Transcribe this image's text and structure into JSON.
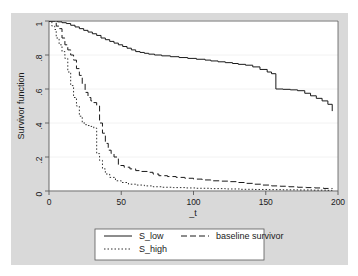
{
  "figure": {
    "background_color": "#ffffff",
    "plot_region_color": "#d9d9d9",
    "plot_area_color": "#ffffff",
    "frame_color": "#4d4d4d",
    "grid_color": "#f2f2f2",
    "line_color": "#1a1a1a"
  },
  "chart_data": {
    "type": "line",
    "title": "",
    "xlabel": "_t",
    "ylabel": "Survivor function",
    "xlim": [
      0,
      200
    ],
    "ylim": [
      0,
      1
    ],
    "xticks": [
      0,
      50,
      100,
      150,
      200
    ],
    "xticklabels": [
      "0",
      "50",
      "100",
      "150",
      "200"
    ],
    "yticks": [
      0,
      0.2,
      0.4,
      0.6,
      0.8,
      1
    ],
    "yticklabels": [
      "0",
      ".2",
      ".4",
      ".6",
      ".8",
      "1"
    ],
    "grid": "horizontal",
    "legend_position": "below",
    "series": [
      {
        "name": "S_low",
        "style": "solid",
        "dash": "none",
        "x": [
          0,
          4,
          6,
          9,
          12,
          15,
          18,
          21,
          24,
          27,
          30,
          33,
          36,
          39,
          42,
          45,
          48,
          51,
          54,
          57,
          60,
          63,
          66,
          69,
          73,
          78,
          84,
          90,
          96,
          102,
          108,
          112,
          117,
          122,
          127,
          131,
          136,
          141,
          146,
          151,
          154,
          157,
          162,
          167,
          172,
          177,
          181,
          185,
          189,
          193,
          196
        ],
        "y": [
          1.0,
          1.0,
          0.995,
          0.99,
          0.985,
          0.975,
          0.965,
          0.955,
          0.945,
          0.935,
          0.925,
          0.915,
          0.9,
          0.89,
          0.88,
          0.87,
          0.86,
          0.85,
          0.84,
          0.83,
          0.82,
          0.815,
          0.81,
          0.805,
          0.8,
          0.795,
          0.79,
          0.785,
          0.78,
          0.775,
          0.77,
          0.765,
          0.76,
          0.755,
          0.75,
          0.745,
          0.74,
          0.73,
          0.715,
          0.7,
          0.69,
          0.6,
          0.598,
          0.595,
          0.59,
          0.575,
          0.56,
          0.545,
          0.53,
          0.51,
          0.47
        ]
      },
      {
        "name": "baseline survivor",
        "style": "dashed",
        "dash": "6,3",
        "x": [
          0,
          3,
          5,
          7,
          9,
          11,
          13,
          15,
          17,
          19,
          21,
          23,
          25,
          27,
          29,
          31,
          33,
          35,
          37,
          39,
          41,
          43,
          45,
          48,
          52,
          56,
          60,
          64,
          68,
          72,
          76,
          82,
          88,
          94,
          100,
          106,
          112,
          118,
          124,
          130,
          136,
          142,
          148,
          154,
          160,
          166,
          172,
          178,
          184,
          190,
          196
        ],
        "y": [
          1.0,
          1.0,
          0.97,
          0.955,
          0.9,
          0.86,
          0.83,
          0.8,
          0.77,
          0.72,
          0.68,
          0.63,
          0.58,
          0.55,
          0.53,
          0.52,
          0.5,
          0.4,
          0.34,
          0.28,
          0.24,
          0.22,
          0.2,
          0.15,
          0.14,
          0.13,
          0.12,
          0.115,
          0.11,
          0.1,
          0.09,
          0.085,
          0.08,
          0.075,
          0.07,
          0.065,
          0.06,
          0.058,
          0.055,
          0.05,
          0.045,
          0.04,
          0.035,
          0.03,
          0.028,
          0.025,
          0.022,
          0.02,
          0.018,
          0.015,
          0.012
        ]
      },
      {
        "name": "S_high",
        "style": "dotted",
        "dash": "1.5,2",
        "x": [
          0,
          2,
          4,
          5,
          7,
          9,
          11,
          13,
          15,
          17,
          19,
          21,
          23,
          25,
          27,
          29,
          31,
          33,
          35,
          37,
          39,
          42,
          46,
          50,
          55,
          60,
          66,
          72,
          78,
          86,
          94,
          102,
          112,
          122,
          132,
          142,
          152,
          162,
          172,
          182,
          192,
          196
        ],
        "y": [
          1.0,
          0.97,
          0.95,
          0.9,
          0.86,
          0.82,
          0.78,
          0.7,
          0.62,
          0.55,
          0.5,
          0.44,
          0.4,
          0.39,
          0.385,
          0.38,
          0.37,
          0.22,
          0.18,
          0.13,
          0.1,
          0.08,
          0.06,
          0.05,
          0.04,
          0.035,
          0.03,
          0.025,
          0.022,
          0.02,
          0.018,
          0.016,
          0.014,
          0.012,
          0.01,
          0.009,
          0.008,
          0.007,
          0.006,
          0.005,
          0.004,
          0.003
        ]
      }
    ],
    "legend": [
      {
        "label": "S_low",
        "style": "solid"
      },
      {
        "label": "baseline survivor",
        "style": "dashed"
      },
      {
        "label": "S_high",
        "style": "dotted"
      }
    ]
  }
}
